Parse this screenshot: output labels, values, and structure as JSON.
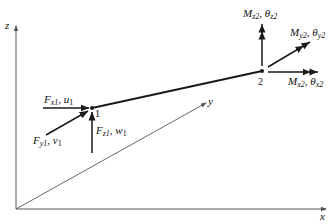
{
  "figure": {
    "axes": {
      "x_label": "x",
      "y_label": "y",
      "z_label": "z"
    },
    "nodes": [
      {
        "id": "1",
        "label": "1"
      },
      {
        "id": "2",
        "label": "2"
      }
    ],
    "node1_loads": {
      "fx": {
        "force": "F",
        "force_sub": "x1",
        "disp": "u",
        "disp_sub": "1"
      },
      "fy": {
        "force": "F",
        "force_sub": "y1",
        "disp": "v",
        "disp_sub": "1"
      },
      "fz": {
        "force": "F",
        "force_sub": "z1",
        "disp": "w",
        "disp_sub": "1"
      }
    },
    "node2_loads": {
      "mx": {
        "moment": "M",
        "moment_sub": "x2",
        "rot": "θ",
        "rot_sub": "x2"
      },
      "my": {
        "moment": "M",
        "moment_sub": "y2",
        "rot": "θ",
        "rot_sub": "y2"
      },
      "mz": {
        "moment": "M",
        "moment_sub": "z2",
        "rot": "θ",
        "rot_sub": "z2"
      }
    },
    "separator": ", ",
    "colors": {
      "line": "#1a1a1a",
      "axis": "#555555",
      "background": "#ffffff"
    }
  }
}
